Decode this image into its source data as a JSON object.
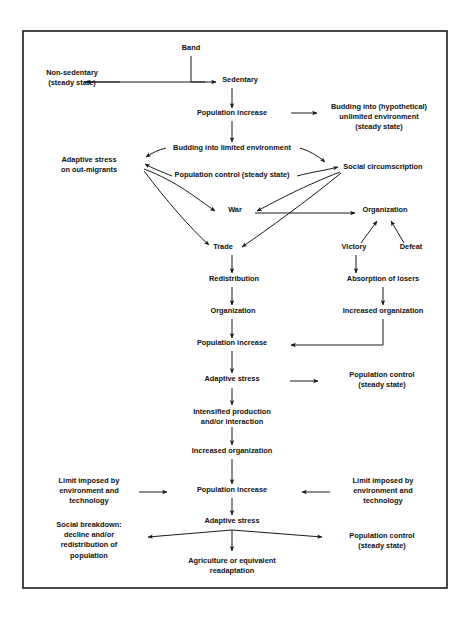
{
  "figure": {
    "type": "flowchart",
    "orientation": "top-down",
    "frame": {
      "x": 23,
      "y": 31,
      "width": 424,
      "height": 557,
      "stroke": "#1a1a1a",
      "stroke_width": 1.6
    },
    "background": "#ffffff",
    "text_color": "#111111",
    "line_color": "#1a1a1a"
  },
  "nodes": [
    {
      "id": "band",
      "lines": [
        "Band"
      ],
      "x": 191,
      "y": 50,
      "anchor": "middle"
    },
    {
      "id": "non-sedentary",
      "lines": [
        "Non-sedentary",
        "(steady state)"
      ],
      "x": 72,
      "y": 75,
      "anchor": "middle"
    },
    {
      "id": "sedentary",
      "lines": [
        "Sedentary"
      ],
      "x": 240,
      "y": 82,
      "anchor": "middle"
    },
    {
      "id": "population-increase-1",
      "lines": [
        "Population increase"
      ],
      "x": 232,
      "y": 115,
      "anchor": "middle"
    },
    {
      "id": "budding-unlimited",
      "lines": [
        "Budding into (hypothetical)",
        "unlimited environment",
        "(steady state)"
      ],
      "x": 379,
      "y": 109,
      "anchor": "middle"
    },
    {
      "id": "budding-limited",
      "lines": [
        "Budding into limited environment"
      ],
      "x": 232,
      "y": 150,
      "anchor": "middle"
    },
    {
      "id": "adaptive-stress-out-migrants",
      "lines": [
        "Adaptive stress",
        "on out-migrants"
      ],
      "x": 89,
      "y": 162,
      "anchor": "middle"
    },
    {
      "id": "social-circumscription",
      "lines": [
        "Social circumscription"
      ],
      "x": 383,
      "y": 169,
      "anchor": "middle"
    },
    {
      "id": "population-control-steady-1",
      "lines": [
        "Population control (steady state)"
      ],
      "x": 232,
      "y": 177,
      "anchor": "middle"
    },
    {
      "id": "war",
      "lines": [
        "War"
      ],
      "x": 235,
      "y": 212,
      "anchor": "middle"
    },
    {
      "id": "organization-1",
      "lines": [
        "Organization"
      ],
      "x": 385,
      "y": 212,
      "anchor": "middle"
    },
    {
      "id": "trade",
      "lines": [
        "Trade"
      ],
      "x": 223,
      "y": 249,
      "anchor": "middle"
    },
    {
      "id": "victory",
      "lines": [
        "Victory"
      ],
      "x": 354,
      "y": 249,
      "anchor": "middle"
    },
    {
      "id": "defeat",
      "lines": [
        "Defeat"
      ],
      "x": 411,
      "y": 249,
      "anchor": "middle"
    },
    {
      "id": "redistribution",
      "lines": [
        "Redistribution"
      ],
      "x": 234,
      "y": 281,
      "anchor": "middle"
    },
    {
      "id": "absorption-of-losers",
      "lines": [
        "Absorption of losers"
      ],
      "x": 383,
      "y": 281,
      "anchor": "middle"
    },
    {
      "id": "organization-2",
      "lines": [
        "Organization"
      ],
      "x": 233,
      "y": 313,
      "anchor": "middle"
    },
    {
      "id": "increased-organization-1",
      "lines": [
        "Increased organization"
      ],
      "x": 383,
      "y": 313,
      "anchor": "middle"
    },
    {
      "id": "population-increase-2",
      "lines": [
        "Population increase"
      ],
      "x": 232,
      "y": 345,
      "anchor": "middle"
    },
    {
      "id": "adaptive-stress-1",
      "lines": [
        "Adaptive stress"
      ],
      "x": 232,
      "y": 381,
      "anchor": "middle"
    },
    {
      "id": "population-control-steady-2",
      "lines": [
        "Population control",
        "(steady state)"
      ],
      "x": 382,
      "y": 377,
      "anchor": "middle"
    },
    {
      "id": "intensified-production",
      "lines": [
        "Intensified production",
        "and/or interaction"
      ],
      "x": 232,
      "y": 414,
      "anchor": "middle"
    },
    {
      "id": "increased-organization-2",
      "lines": [
        "Increased organization"
      ],
      "x": 232,
      "y": 453,
      "anchor": "middle"
    },
    {
      "id": "limit-imposed-left",
      "lines": [
        "Limit imposed by",
        "environment and",
        "technology"
      ],
      "x": 89,
      "y": 483,
      "anchor": "middle"
    },
    {
      "id": "population-increase-3",
      "lines": [
        "Population increase"
      ],
      "x": 232,
      "y": 492,
      "anchor": "middle"
    },
    {
      "id": "limit-imposed-right",
      "lines": [
        "Limit imposed by",
        "environment and",
        "technology"
      ],
      "x": 383,
      "y": 483,
      "anchor": "middle"
    },
    {
      "id": "adaptive-stress-2",
      "lines": [
        "Adaptive stress"
      ],
      "x": 232,
      "y": 523,
      "anchor": "middle"
    },
    {
      "id": "social-breakdown",
      "lines": [
        "Social breakdown:",
        "decline and/or",
        "redistribution of",
        "population"
      ],
      "x": 89,
      "y": 527,
      "anchor": "middle"
    },
    {
      "id": "population-control-steady-3",
      "lines": [
        "Population control",
        "(steady state)"
      ],
      "x": 382,
      "y": 538,
      "anchor": "middle"
    },
    {
      "id": "agriculture-readaptation",
      "lines": [
        "Agriculture or equivalent",
        "readaptation"
      ],
      "x": 232,
      "y": 563,
      "anchor": "middle"
    }
  ],
  "edges": [
    {
      "id": "band-to-split",
      "from": "band",
      "to": "split-point",
      "kind": "plain-line"
    },
    {
      "id": "split-to-non-sedentary",
      "from": "band",
      "to": "non-sedentary",
      "kind": "arrow-left"
    },
    {
      "id": "split-to-sedentary",
      "from": "band",
      "to": "sedentary",
      "kind": "arrow-right"
    },
    {
      "id": "sedentary-to-pop-inc-1",
      "from": "sedentary",
      "to": "population-increase-1",
      "kind": "arrow-down"
    },
    {
      "id": "pop-inc-1-to-budding-unlimited",
      "from": "population-increase-1",
      "to": "budding-unlimited",
      "kind": "arrow-right"
    },
    {
      "id": "pop-inc-1-to-budding-limited",
      "from": "population-increase-1",
      "to": "budding-limited",
      "kind": "arrow-down"
    },
    {
      "id": "budding-limited-to-adaptive-stress",
      "from": "budding-limited",
      "to": "adaptive-stress-out-migrants",
      "kind": "arrow-curve-left"
    },
    {
      "id": "budding-limited-to-social-circumscription",
      "from": "budding-limited",
      "to": "social-circumscription",
      "kind": "arrow-curve-right"
    },
    {
      "id": "pop-control-to-adaptive-stress",
      "from": "population-control-steady-1",
      "to": "adaptive-stress-out-migrants",
      "kind": "arrow-curve-left"
    },
    {
      "id": "pop-control-to-social-circumscription",
      "from": "population-control-steady-1",
      "to": "social-circumscription",
      "kind": "arrow-curve-right"
    },
    {
      "id": "left-hub-to-war",
      "from": "adaptive-stress-out-migrants",
      "to": "war",
      "kind": "arrow-right"
    },
    {
      "id": "left-hub-to-trade",
      "from": "adaptive-stress-out-migrants",
      "to": "trade",
      "kind": "arrow-down-right"
    },
    {
      "id": "social-circumscription-to-war",
      "from": "social-circumscription",
      "to": "war",
      "kind": "arrow-left"
    },
    {
      "id": "social-circumscription-to-trade",
      "from": "social-circumscription",
      "to": "trade",
      "kind": "arrow-down-left"
    },
    {
      "id": "war-to-organization",
      "from": "war",
      "to": "organization-1",
      "kind": "arrow-right"
    },
    {
      "id": "organization-to-victory",
      "from": "organization-1",
      "to": "victory",
      "kind": "arrow-up-from-victory"
    },
    {
      "id": "organization-to-defeat",
      "from": "organization-1",
      "to": "defeat",
      "kind": "arrow-up-from-defeat"
    },
    {
      "id": "trade-to-redistribution",
      "from": "trade",
      "to": "redistribution",
      "kind": "arrow-down"
    },
    {
      "id": "victory-to-absorption",
      "from": "victory",
      "to": "absorption-of-losers",
      "kind": "arrow-down"
    },
    {
      "id": "redistribution-to-organization",
      "from": "redistribution",
      "to": "organization-2",
      "kind": "arrow-down"
    },
    {
      "id": "absorption-to-increased-org",
      "from": "absorption-of-losers",
      "to": "increased-organization-1",
      "kind": "arrow-down"
    },
    {
      "id": "organization-2-to-pop-inc-2",
      "from": "organization-2",
      "to": "population-increase-2",
      "kind": "arrow-down"
    },
    {
      "id": "increased-org-1-to-pop-inc-2",
      "from": "increased-organization-1",
      "to": "population-increase-2",
      "kind": "elbow-arrow-left"
    },
    {
      "id": "pop-inc-2-to-adaptive-stress-1",
      "from": "population-increase-2",
      "to": "adaptive-stress-1",
      "kind": "arrow-down"
    },
    {
      "id": "adaptive-stress-1-to-pop-control-2",
      "from": "adaptive-stress-1",
      "to": "population-control-steady-2",
      "kind": "arrow-right"
    },
    {
      "id": "adaptive-stress-1-to-intensified",
      "from": "adaptive-stress-1",
      "to": "intensified-production",
      "kind": "arrow-down"
    },
    {
      "id": "intensified-to-increased-org-2",
      "from": "intensified-production",
      "to": "increased-organization-2",
      "kind": "arrow-down"
    },
    {
      "id": "increased-org-2-to-pop-inc-3",
      "from": "increased-organization-2",
      "to": "population-increase-3",
      "kind": "arrow-down"
    },
    {
      "id": "limit-left-to-pop-inc-3",
      "from": "limit-imposed-left",
      "to": "population-increase-3",
      "kind": "arrow-right"
    },
    {
      "id": "limit-right-to-pop-inc-3",
      "from": "limit-imposed-right",
      "to": "population-increase-3",
      "kind": "arrow-left"
    },
    {
      "id": "pop-inc-3-to-adaptive-stress-2",
      "from": "population-increase-3",
      "to": "adaptive-stress-2",
      "kind": "arrow-down"
    },
    {
      "id": "adaptive-stress-2-to-social-breakdown",
      "from": "adaptive-stress-2",
      "to": "social-breakdown",
      "kind": "arrow-fan-left"
    },
    {
      "id": "adaptive-stress-2-to-pop-control-3",
      "from": "adaptive-stress-2",
      "to": "population-control-steady-3",
      "kind": "arrow-fan-right"
    },
    {
      "id": "adaptive-stress-2-to-agriculture",
      "from": "adaptive-stress-2",
      "to": "agriculture-readaptation",
      "kind": "arrow-down"
    }
  ],
  "geometry": {
    "paths": [
      {
        "name": "band-stem",
        "d": "M191,56 L191,82",
        "head": "none"
      },
      {
        "name": "band-crossbar",
        "d": "M84,82 L205,82",
        "head": "none"
      },
      {
        "name": "arrow-to-non-sedentary",
        "d": "M120,82 L86,82",
        "head": "end"
      },
      {
        "name": "arrow-to-sedentary",
        "d": "M191,82 L216,82",
        "head": "end"
      },
      {
        "name": "sedentary-to-pop-inc-1",
        "d": "M232,88 L232,108",
        "head": "end"
      },
      {
        "name": "pop-inc-1-to-budding-unlimited",
        "d": "M291,113 L317,113",
        "head": "end"
      },
      {
        "name": "pop-inc-1-to-budding-limited",
        "d": "M232,121 L232,142",
        "head": "end"
      },
      {
        "name": "budding-limited-left",
        "d": "M166,148 C158,150 152,153 146,157",
        "head": "end"
      },
      {
        "name": "budding-limited-right",
        "d": "M300,148 C310,151 318,156 325,162",
        "head": "end"
      },
      {
        "name": "hub-left-to-popctl",
        "d": "M172,176 C162,172 152,168 145,164",
        "head": "end"
      },
      {
        "name": "hub-right-to-popctl",
        "d": "M297,176 C312,172 327,170 338,167",
        "head": "end"
      },
      {
        "name": "left-hub-to-war",
        "d": "M144,169 C178,182 196,198 215,211",
        "head": "end"
      },
      {
        "name": "left-hub-to-trade",
        "d": "M144,171 C166,200 190,228 209,245",
        "head": "end"
      },
      {
        "name": "right-hub-to-war",
        "d": "M340,172 C304,186 278,200 257,211",
        "head": "end"
      },
      {
        "name": "right-hub-to-trade",
        "d": "M341,173 C307,201 268,229 242,247",
        "head": "end"
      },
      {
        "name": "war-to-organization",
        "d": "M255,213 L355,213",
        "head": "end"
      },
      {
        "name": "victory-to-organization",
        "d": "M361,243 L377,221",
        "head": "end"
      },
      {
        "name": "defeat-to-organization",
        "d": "M404,243 L391,221",
        "head": "end"
      },
      {
        "name": "trade-to-redistribution",
        "d": "M232,255 L232,273",
        "head": "end"
      },
      {
        "name": "victory-to-absorption",
        "d": "M356,255 L356,273",
        "head": "end"
      },
      {
        "name": "redistribution-to-organization",
        "d": "M232,287 L232,305",
        "head": "end"
      },
      {
        "name": "absorption-to-increased-org",
        "d": "M383,287 L383,305",
        "head": "end"
      },
      {
        "name": "organization-to-pop-inc-2",
        "d": "M232,319 L232,338",
        "head": "end"
      },
      {
        "name": "increased-org-elbow",
        "d": "M383,319 L383,345 L291,345",
        "head": "end"
      },
      {
        "name": "pop-inc-2-to-adaptive-stress",
        "d": "M232,351 L232,373",
        "head": "end"
      },
      {
        "name": "adaptive-stress-to-pop-ctl-2",
        "d": "M290,381 L318,381",
        "head": "end"
      },
      {
        "name": "adaptive-stress-to-intensified",
        "d": "M232,388 L232,405",
        "head": "end"
      },
      {
        "name": "intensified-to-increased-org",
        "d": "M232,427 L232,445",
        "head": "end"
      },
      {
        "name": "increased-org-to-pop-inc-3",
        "d": "M232,459 L232,484",
        "head": "end"
      },
      {
        "name": "limit-left-to-pop-inc-3",
        "d": "M139,492 L167,492",
        "head": "end"
      },
      {
        "name": "limit-right-to-pop-inc-3",
        "d": "M330,492 L302,492",
        "head": "end"
      },
      {
        "name": "pop-inc-3-to-adaptive-stress-2",
        "d": "M232,498 L232,515",
        "head": "end"
      },
      {
        "name": "fan-left",
        "d": "M232,530 L148,537",
        "head": "end"
      },
      {
        "name": "fan-right",
        "d": "M232,530 L322,537",
        "head": "end"
      },
      {
        "name": "adaptive-stress-2-to-agriculture",
        "d": "M232,530 L232,551",
        "head": "end"
      }
    ]
  }
}
